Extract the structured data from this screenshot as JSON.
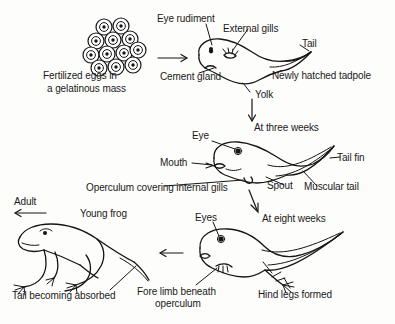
{
  "diagram": {
    "background_color": "#fdfdfb",
    "ink_color": "#151515"
  },
  "stages": {
    "eggs": {
      "caption_line1": "Fertilized eggs in",
      "caption_line2": "a gelatinous mass",
      "egg_count": 12
    },
    "hatchling": {
      "stage_label": "Newly hatched tadpole",
      "labels": {
        "eye_rudiment": "Eye rudiment",
        "external_gills": "External gills",
        "tail": "Tail",
        "cement_gland": "Cement gland",
        "yolk": "Yolk"
      }
    },
    "three_weeks": {
      "stage_label": "At three weeks",
      "labels": {
        "eye": "Eye",
        "mouth": "Mouth",
        "operculum": "Operculum covering internal gills",
        "spout": "Spout",
        "muscular_tail": "Muscular tail",
        "tail_fin": "Tail fin"
      }
    },
    "eight_weeks": {
      "stage_label": "At eight weeks",
      "labels": {
        "eyes": "Eyes",
        "fore_limb_line1": "Fore limb beneath",
        "fore_limb_line2": "operculum",
        "hind_legs": "Hind legs formed"
      }
    },
    "young_frog": {
      "stage_label": "Young frog",
      "labels": {
        "tail_absorbed": "Tail becoming absorbed"
      }
    },
    "adult": {
      "stage_label": "Adult"
    }
  },
  "arrows": [
    {
      "name": "eggs-to-hatchling",
      "direction": "right"
    },
    {
      "name": "hatchling-to-three-weeks",
      "direction": "down"
    },
    {
      "name": "three-weeks-to-eight-weeks",
      "direction": "down"
    },
    {
      "name": "eight-weeks-to-young-frog",
      "direction": "left"
    },
    {
      "name": "young-frog-to-adult",
      "direction": "left"
    }
  ]
}
